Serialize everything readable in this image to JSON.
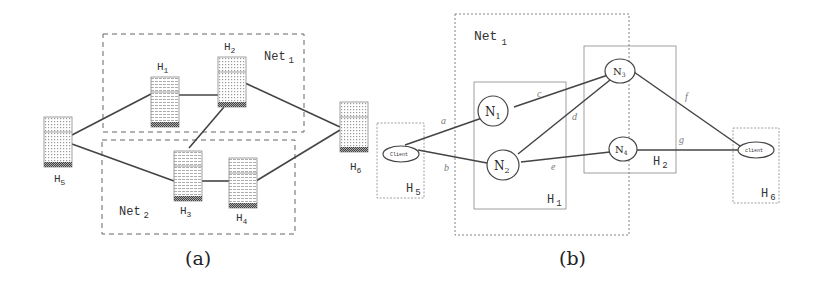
{
  "figure_a": {
    "caption": "(a)",
    "groups": [
      {
        "name": "Net",
        "sub": "1"
      },
      {
        "name": "Net",
        "sub": "2"
      }
    ],
    "hosts": [
      {
        "id": "H1",
        "label": "H",
        "sub": "1"
      },
      {
        "id": "H2",
        "label": "H",
        "sub": "2"
      },
      {
        "id": "H3",
        "label": "H",
        "sub": "3"
      },
      {
        "id": "H4",
        "label": "H",
        "sub": "4"
      },
      {
        "id": "H5",
        "label": "H",
        "sub": "5"
      },
      {
        "id": "H6",
        "label": "H",
        "sub": "6"
      }
    ],
    "links": [
      [
        "H5",
        "H1"
      ],
      [
        "H1",
        "H2"
      ],
      [
        "H2",
        "H6"
      ],
      [
        "H2",
        "H3"
      ],
      [
        "H5",
        "H3"
      ],
      [
        "H3",
        "H4"
      ],
      [
        "H4",
        "H6"
      ]
    ]
  },
  "figure_b": {
    "caption": "(b)",
    "group": {
      "name": "Net",
      "sub": "1"
    },
    "hosts": [
      {
        "id": "H1",
        "label": "H",
        "sub": "1"
      },
      {
        "id": "H2",
        "label": "H",
        "sub": "2"
      },
      {
        "id": "H5",
        "label": "H",
        "sub": "5"
      },
      {
        "id": "H6",
        "label": "H",
        "sub": "6"
      }
    ],
    "nodes": [
      {
        "id": "N1",
        "label": "N",
        "sub": "1"
      },
      {
        "id": "N2",
        "label": "N",
        "sub": "2"
      },
      {
        "id": "N3",
        "label": "N",
        "sub": "3"
      },
      {
        "id": "N4",
        "label": "N",
        "sub": "4"
      },
      {
        "id": "client-left",
        "label": "Client"
      },
      {
        "id": "client-right",
        "label": "client"
      }
    ],
    "edges": [
      {
        "label": "a",
        "from": "client-left",
        "to": "N1"
      },
      {
        "label": "b",
        "from": "client-left",
        "to": "N2"
      },
      {
        "label": "c",
        "from": "N1",
        "to": "N3"
      },
      {
        "label": "d",
        "from": "N2",
        "to": "N3"
      },
      {
        "label": "e",
        "from": "N2",
        "to": "N4"
      },
      {
        "label": "f",
        "from": "N3",
        "to": "client-right"
      },
      {
        "label": "g",
        "from": "N4",
        "to": "client-right"
      }
    ]
  }
}
